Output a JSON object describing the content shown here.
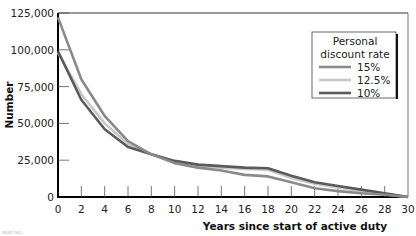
{
  "chart_data": {
    "type": "line",
    "title": "",
    "xlabel": "Years since start of active duty",
    "ylabel": "Number",
    "xlim": [
      0,
      30
    ],
    "ylim": [
      0,
      125000
    ],
    "x_ticks": [
      0,
      2,
      4,
      6,
      8,
      10,
      12,
      14,
      16,
      18,
      20,
      22,
      24,
      26,
      28,
      30
    ],
    "y_ticks": [
      0,
      25000,
      50000,
      75000,
      100000,
      125000
    ],
    "y_tick_labels": [
      "0",
      "25,000",
      "50,000",
      "75,000",
      "100,000",
      "125,000"
    ],
    "x_tick_labels": [
      "0",
      "2",
      "4",
      "6",
      "8",
      "10",
      "12",
      "14",
      "16",
      "18",
      "20",
      "22",
      "24",
      "26",
      "28",
      "30"
    ],
    "grid": false,
    "legend": {
      "title_line1": "Personal",
      "title_line2": "discount rate",
      "position": "upper right",
      "entries": [
        "15%",
        "12.5%",
        "10%"
      ]
    },
    "x": [
      0,
      2,
      4,
      6,
      8,
      10,
      12,
      14,
      16,
      18,
      20,
      22,
      24,
      26,
      28,
      30
    ],
    "series": [
      {
        "name": "15%",
        "color": "#8a8a8a",
        "values": [
          122000,
          80000,
          55000,
          38000,
          29000,
          23000,
          20000,
          18000,
          15000,
          14000,
          10000,
          6000,
          4000,
          2500,
          1500,
          0
        ]
      },
      {
        "name": "12.5%",
        "color": "#c8c8c8",
        "values": [
          98000,
          70000,
          50000,
          36000,
          29000,
          24000,
          21000,
          20000,
          19000,
          18500,
          13000,
          9000,
          6500,
          4000,
          2000,
          0
        ]
      },
      {
        "name": "10%",
        "color": "#5a5a5a",
        "values": [
          99000,
          66000,
          46000,
          34000,
          29000,
          24500,
          22000,
          21000,
          20000,
          19500,
          14500,
          10000,
          7500,
          5000,
          2500,
          0
        ]
      }
    ]
  },
  "source_note": "RAND MG..."
}
